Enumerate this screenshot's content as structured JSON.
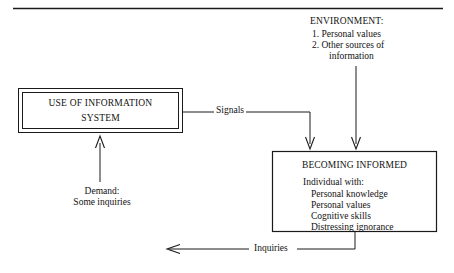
{
  "diagram": {
    "top_rule": "horizontal-rule",
    "environment": {
      "title": "ENVIRONMENT:",
      "items": [
        "1. Personal values",
        "2. Other sources of",
        "information"
      ]
    },
    "use_box": {
      "line1": "USE OF INFORMATION",
      "line2": "SYSTEM"
    },
    "becoming_box": {
      "title": "BECOMING INFORMED",
      "subtitle": "Individual with:",
      "items": [
        "Personal knowledge",
        "Personal values",
        "Cognitive skills",
        "Distressing ignorance"
      ]
    },
    "edges": {
      "signals": "Signals",
      "inquiries": "Inquiries",
      "demand_line1": "Demand:",
      "demand_line2": "Some inquiries"
    },
    "colors": {
      "stroke": "#1a1a1a",
      "text": "#111111",
      "background": "#ffffff"
    }
  }
}
